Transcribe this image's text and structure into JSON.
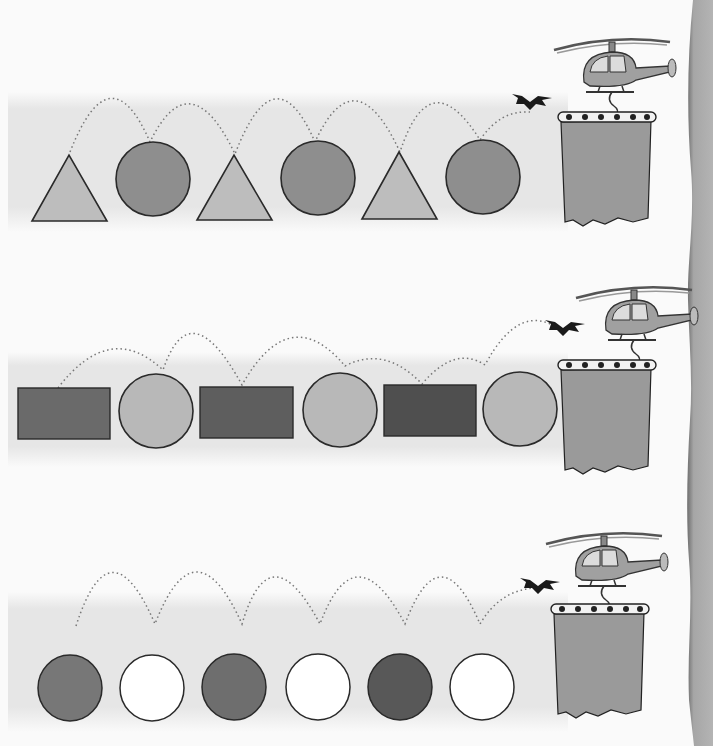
{
  "worksheet": {
    "rows": [
      {
        "id": "row-1",
        "pattern": [
          "triangle",
          "circle",
          "triangle",
          "circle",
          "triangle",
          "circle"
        ],
        "shape_colors": {
          "triangle": "#bdbdbd",
          "circle": "#8e8e8e"
        },
        "target": "curtain-basket"
      },
      {
        "id": "row-2",
        "pattern": [
          "rectangle",
          "circle",
          "rectangle",
          "circle",
          "rectangle",
          "circle"
        ],
        "shape_colors": {
          "rectangle": "#6a6a6a",
          "circle": "#b8b8b8"
        },
        "target": "curtain-basket"
      },
      {
        "id": "row-3",
        "pattern": [
          "dark-oval",
          "white-oval",
          "dark-oval",
          "white-oval",
          "dark-oval",
          "white-oval"
        ],
        "shape_colors": {
          "dark-oval": "#777777",
          "white-oval": "#ffffff"
        },
        "target": "curtain-basket"
      }
    ],
    "decorations": [
      "helicopter",
      "bat",
      "curtain-basket",
      "dotted-jump-path"
    ],
    "colors": {
      "background": "#fafafa",
      "band": "#e6e6e6",
      "outline": "#2a2a2a",
      "curtain": "#9a9a9a",
      "page_edge": "#a8a8a8",
      "helicopter_body": "#a0a0a0",
      "helicopter_window": "#dcdcdc",
      "bat": "#1a1a1a"
    }
  }
}
